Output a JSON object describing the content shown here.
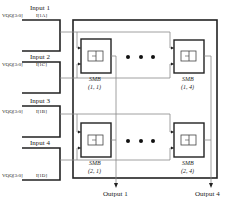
{
  "diagram": {
    "inputs": [
      {
        "label": "Input 1",
        "bus": "VQQ[3:0]",
        "tag": "I[1A]"
      },
      {
        "label": "Input 2",
        "bus": "VQQ[3:0]",
        "tag": "I[1C]"
      },
      {
        "label": "Input 3",
        "bus": "VQQ[3:0]",
        "tag": "I[1B]"
      },
      {
        "label": "Input 4",
        "bus": "VQQ[3:0]",
        "tag": "I[1D]"
      }
    ],
    "blocks": [
      {
        "name": "SMB",
        "index": "(1, 1)"
      },
      {
        "name": "SMB",
        "index": "(1, 4)"
      },
      {
        "name": "SMB",
        "index": "(2, 1)"
      },
      {
        "name": "SMB",
        "index": "(2, 4)"
      }
    ],
    "ellipsis": "• • •",
    "outputs": [
      {
        "label": "Output 1"
      },
      {
        "label": "Output 4"
      }
    ],
    "colors": {
      "line": "#222222",
      "wire": "#888888"
    }
  }
}
